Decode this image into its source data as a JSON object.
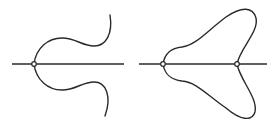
{
  "figures": [
    {
      "id": "left-figure",
      "description": "Open curve crossing a horizontal line at one node, ending in two tails curving away",
      "axis": {
        "x1": 12,
        "x2": 124,
        "y": 64
      },
      "nodes": [
        {
          "cx": 34,
          "cy": 64
        }
      ]
    },
    {
      "id": "right-figure",
      "description": "Closed three-lobed loop crossing a horizontal line at two nodes",
      "axis": {
        "x1": 139,
        "x2": 267,
        "y": 64
      },
      "nodes": [
        {
          "cx": 163,
          "cy": 64
        },
        {
          "cx": 237,
          "cy": 64
        }
      ]
    }
  ],
  "colors": {
    "stroke": "#2a2a2a",
    "background": "#ffffff"
  }
}
